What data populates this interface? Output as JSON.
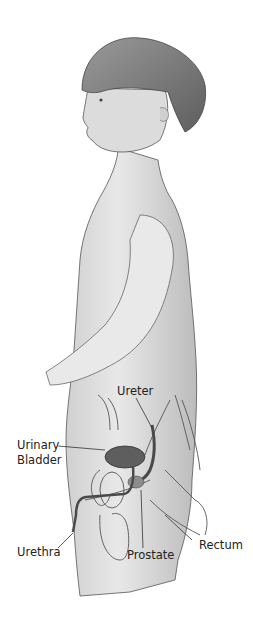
{
  "figure": {
    "labels": {
      "ureter": "Ureter",
      "urinary_bladder_line1": "Urinary",
      "urinary_bladder_line2": "Bladder",
      "urethra": "Urethra",
      "prostate": "Prostate",
      "rectum": "Rectum"
    },
    "colors": {
      "skin_light": "#e6e6e6",
      "skin_mid": "#c8c8c8",
      "hair": "#7a7a7a",
      "organ_dark": "#5a5a5a",
      "outline": "#444444",
      "text": "#222222"
    }
  }
}
